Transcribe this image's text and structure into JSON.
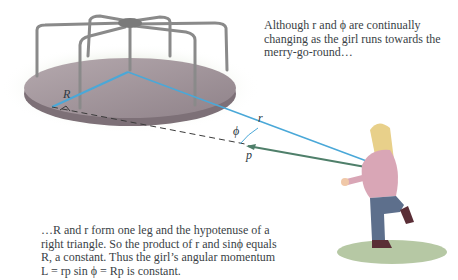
{
  "figure": {
    "captions": {
      "top": "Although r and ϕ are continually changing as the girl runs towards the merry-go-round…",
      "bottom": "…R and r form one leg and the hypotenuse of a right triangle. So the product of r and sinϕ equals R, a constant. Thus the girl’s angular momentum L = rp sin ϕ = Rp is constant."
    },
    "labels": {
      "R": "R",
      "r": "r",
      "phi": "ϕ",
      "p": "p⃗"
    },
    "colors": {
      "vector_blue": "#4aa8d8",
      "momentum_green": "#4f7f6a",
      "disk": "#9e9198",
      "grass": "#7a9a5a",
      "hoodie": "#d9a6b6",
      "jeans": "#5d6f8c",
      "hair": "#e8d08a"
    }
  }
}
